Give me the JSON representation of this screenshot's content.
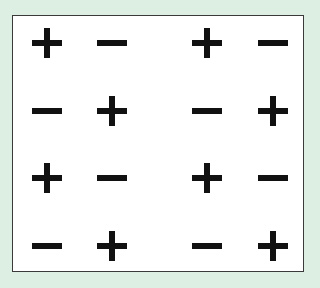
{
  "diagram": {
    "rows": [
      [
        "+",
        "-",
        "+",
        "-"
      ],
      [
        "-",
        "+",
        "-",
        "+"
      ],
      [
        "+",
        "-",
        "+",
        "-"
      ],
      [
        "-",
        "+",
        "-",
        "+"
      ]
    ],
    "colors": {
      "background": "#dcefe2",
      "panel": "#ffffff",
      "sign": "#111111",
      "border": "#3a3a3a"
    }
  }
}
